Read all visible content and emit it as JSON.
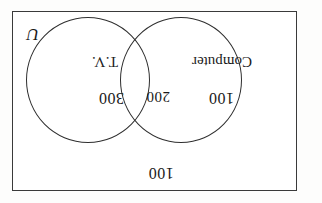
{
  "figure": {
    "kind": "venn-diagram",
    "orientation_note": "180-degree-rotated scan",
    "universal_set_symbol": "U",
    "background_color": "#ffffff",
    "line_color": "#2e2e2e",
    "text_color": "#1a1a1a"
  },
  "chart_data": {
    "type": "venn",
    "title": "",
    "universal_set_label": "U",
    "sets": [
      {
        "name": "Computer",
        "region": "left-only",
        "value": 100
      },
      {
        "name": "T.V.",
        "region": "right-only",
        "value": 300
      }
    ],
    "intersection": {
      "label": "Computer and T.V.",
      "value": 200
    },
    "outside": {
      "label": "neither",
      "value": 100
    },
    "total": 700
  },
  "labels": {
    "outside_count": "100",
    "left_count": "100",
    "intersection_count": "200",
    "right_count": "300",
    "left_set_name": "Computer",
    "right_set_name": "T.V.",
    "universal_symbol": "U"
  }
}
